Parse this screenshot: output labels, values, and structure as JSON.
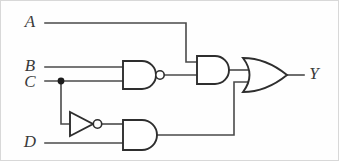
{
  "figure": {
    "kind": "logic-circuit-diagram",
    "width": 339,
    "height": 161,
    "background_color": "#fefefe",
    "wire_color": "#4a4a4a",
    "gate_color": "#2e2e2e",
    "label_color": "#3a3a3a"
  },
  "labels": {
    "input_a": "A",
    "input_b": "B",
    "input_c": "C",
    "input_d": "D",
    "output_y": "Y"
  },
  "gates": [
    {
      "id": "nand1",
      "type": "NAND",
      "inputs": [
        "B",
        "C"
      ],
      "inverted_output": true,
      "x": 123,
      "y": 61,
      "width": 34,
      "height": 28
    },
    {
      "id": "not1",
      "type": "NOT",
      "inputs": [
        "C"
      ],
      "inverted_output": true,
      "x": 70,
      "y": 112,
      "width": 26,
      "height": 24
    },
    {
      "id": "and2",
      "type": "AND",
      "inputs": [
        "not1",
        "D"
      ],
      "inverted_output": false,
      "x": 123,
      "y": 120,
      "width": 34,
      "height": 30
    },
    {
      "id": "and1",
      "type": "AND",
      "inputs": [
        "A",
        "nand1"
      ],
      "inverted_output": false,
      "x": 197,
      "y": 56,
      "width": 32,
      "height": 28
    },
    {
      "id": "or1",
      "type": "OR",
      "inputs": [
        "and1",
        "and2"
      ],
      "inverted_output": false,
      "x": 243,
      "y": 58,
      "width": 45,
      "height": 34
    }
  ],
  "nets": [
    {
      "id": "net-a",
      "from": "A",
      "to": "and1.in1"
    },
    {
      "id": "net-b",
      "from": "B",
      "to": "nand1.in1"
    },
    {
      "id": "net-c",
      "from": "C",
      "to": "nand1.in2"
    },
    {
      "id": "net-c-branch",
      "from": "C",
      "to": "not1.in"
    },
    {
      "id": "net-nand1",
      "from": "nand1",
      "to": "and1.in2"
    },
    {
      "id": "net-not1",
      "from": "not1",
      "to": "and2.in1"
    },
    {
      "id": "net-d",
      "from": "D",
      "to": "and2.in2"
    },
    {
      "id": "net-and1",
      "from": "and1",
      "to": "or1.in1"
    },
    {
      "id": "net-and2",
      "from": "and2",
      "to": "or1.in2"
    },
    {
      "id": "net-out",
      "from": "or1",
      "to": "Y"
    }
  ],
  "junctions": [
    {
      "id": "junction-c",
      "x": 61,
      "y": 81,
      "r": 3.4
    }
  ]
}
